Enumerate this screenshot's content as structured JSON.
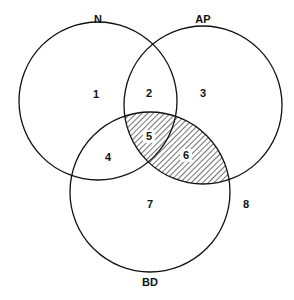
{
  "diagram": {
    "type": "venn",
    "sets": [
      {
        "id": "N",
        "label": "N",
        "cx": 98,
        "cy": 101,
        "r": 79
      },
      {
        "id": "AP",
        "label": "AP",
        "cx": 203,
        "cy": 105,
        "r": 79
      },
      {
        "id": "BD",
        "label": "BD",
        "cx": 150,
        "cy": 192,
        "r": 80
      }
    ],
    "regions": [
      {
        "label": "1",
        "x": 96,
        "y": 98
      },
      {
        "label": "2",
        "x": 149,
        "y": 97
      },
      {
        "label": "3",
        "x": 203,
        "y": 97
      },
      {
        "label": "4",
        "x": 108,
        "y": 161
      },
      {
        "label": "5",
        "x": 149,
        "y": 140
      },
      {
        "label": "6",
        "x": 186,
        "y": 159
      },
      {
        "label": "7",
        "x": 150,
        "y": 208
      },
      {
        "label": "8",
        "x": 246,
        "y": 208
      }
    ],
    "shaded": "AP ∩ BD (regions 5 and 6)",
    "line_color": "#111111",
    "background": "#ffffff"
  }
}
